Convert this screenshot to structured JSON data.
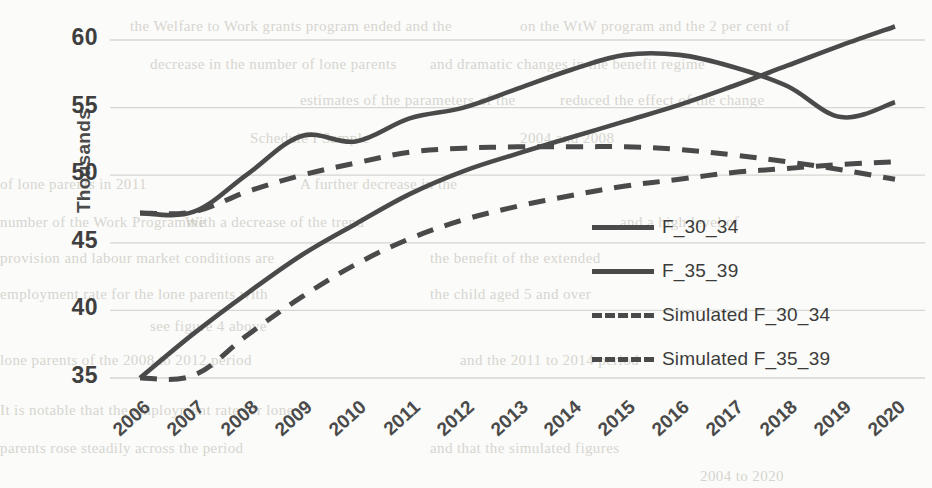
{
  "chart_data": {
    "type": "line",
    "title": "",
    "xlabel": "",
    "ylabel": "Thousands",
    "categories": [
      "2006",
      "2007",
      "2008",
      "2009",
      "2010",
      "2011",
      "2012",
      "2013",
      "2014",
      "2015",
      "2016",
      "2017",
      "2018",
      "2019",
      "2020"
    ],
    "ylim": [
      35,
      60
    ],
    "yticks": [
      35,
      40,
      45,
      50,
      55,
      60
    ],
    "xlim_note": "2006 to 2020, one tick per year",
    "grid": "horizontal",
    "legend_position": "inside-right",
    "series": [
      {
        "name": "F_30_34",
        "style": "solid",
        "color": "#4a4a4a",
        "values": [
          47.2,
          47.3,
          50.1,
          52.9,
          52.5,
          54.2,
          55.0,
          56.4,
          57.8,
          58.9,
          58.9,
          58.0,
          56.6,
          54.3,
          55.4
        ]
      },
      {
        "name": "F_35_39",
        "style": "solid",
        "color": "#4a4a4a",
        "values": [
          35.0,
          38.3,
          41.3,
          44.1,
          46.4,
          48.6,
          50.3,
          51.6,
          52.8,
          54.0,
          55.2,
          56.6,
          58.1,
          59.6,
          61.0
        ]
      },
      {
        "name": "Simulated F_30_34",
        "style": "dashed",
        "color": "#4a4a4a",
        "values": [
          47.2,
          47.3,
          48.8,
          50.0,
          50.9,
          51.7,
          52.0,
          52.1,
          52.1,
          52.1,
          51.9,
          51.5,
          51.0,
          50.4,
          49.7
        ]
      },
      {
        "name": "Simulated F_35_39",
        "style": "dashed",
        "color": "#4a4a4a",
        "values": [
          35.0,
          35.2,
          38.2,
          41.0,
          43.4,
          45.3,
          46.7,
          47.7,
          48.5,
          49.2,
          49.7,
          50.2,
          50.5,
          50.8,
          51.0
        ]
      }
    ]
  },
  "legend": {
    "items": [
      {
        "label": "F_30_34",
        "style": "solid"
      },
      {
        "label": "F_35_39",
        "style": "solid"
      },
      {
        "label": "Simulated F_30_34",
        "style": "dashed"
      },
      {
        "label": "Simulated F_35_39",
        "style": "dashed"
      }
    ]
  },
  "background_bleed": [
    {
      "text": "the Welfare to Work grants  program   ended  and   the",
      "x": 130,
      "y": 18
    },
    {
      "text": "on the  WtW  program  and  the  2 per cent of",
      "x": 520,
      "y": 18
    },
    {
      "text": "decrease  in  the  number  of  lone  parents",
      "x": 150,
      "y": 56
    },
    {
      "text": "and  dramatic  changes  in  the  benefit  regime",
      "x": 430,
      "y": 56
    },
    {
      "text": "estimates  of  the  parameters  of  the",
      "x": 300,
      "y": 92
    },
    {
      "text": "reduced  the  effect  of  the  change",
      "x": 560,
      "y": 92
    },
    {
      "text": "Schedule  I  Sample",
      "x": 250,
      "y": 130
    },
    {
      "text": "2004  and  2008",
      "x": 520,
      "y": 130
    },
    {
      "text": "of  lone  parents  in  2011",
      "x": 0,
      "y": 176
    },
    {
      "text": "A  further  decrease  in  the",
      "x": 300,
      "y": 176
    },
    {
      "text": "number  of  the  Work  Programme",
      "x": 0,
      "y": 214
    },
    {
      "text": "With  a  decrease  of  the  trend",
      "x": 185,
      "y": 214
    },
    {
      "text": "and  a  high  level  of",
      "x": 620,
      "y": 214
    },
    {
      "text": "provision  and  labour  market  conditions  are",
      "x": 0,
      "y": 250
    },
    {
      "text": "the  benefit  of  the  extended",
      "x": 430,
      "y": 250
    },
    {
      "text": "employment  rate  for  the  lone  parents  with",
      "x": 0,
      "y": 286
    },
    {
      "text": "the  child  aged  5  and  over",
      "x": 430,
      "y": 286
    },
    {
      "text": "see  figure  4  above",
      "x": 150,
      "y": 318
    },
    {
      "text": "lone  parents  of  the  2008  to  2012  period",
      "x": 0,
      "y": 352
    },
    {
      "text": "and  the  2011  to  2014  period",
      "x": 460,
      "y": 352
    },
    {
      "text": "It  is  notable  that  the  employment  rate  for  lone",
      "x": 0,
      "y": 402
    },
    {
      "text": "parents  rose  steadily  across  the  period",
      "x": 0,
      "y": 440
    },
    {
      "text": "and  that  the  simulated  figures",
      "x": 430,
      "y": 440
    },
    {
      "text": "2004  to  2020",
      "x": 700,
      "y": 468
    }
  ]
}
